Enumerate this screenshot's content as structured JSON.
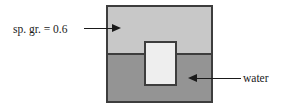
{
  "figure": {
    "type": "physics-free-body-diagram"
  },
  "labels": {
    "upper_fluid": "sp. gr. = 0.6",
    "lower_fluid": "water"
  },
  "regions": {
    "upper_fluid": {
      "name": "sp. gr. = 0.6",
      "color": "#c8c8c8"
    },
    "lower_fluid": {
      "name": "water",
      "color": "#949494"
    },
    "block": {
      "name": "floating block",
      "color": "#eeeeee"
    }
  },
  "colors": {
    "outline": "#3d3d3d",
    "text": "#1a1a1a",
    "background": "#ffffff"
  }
}
